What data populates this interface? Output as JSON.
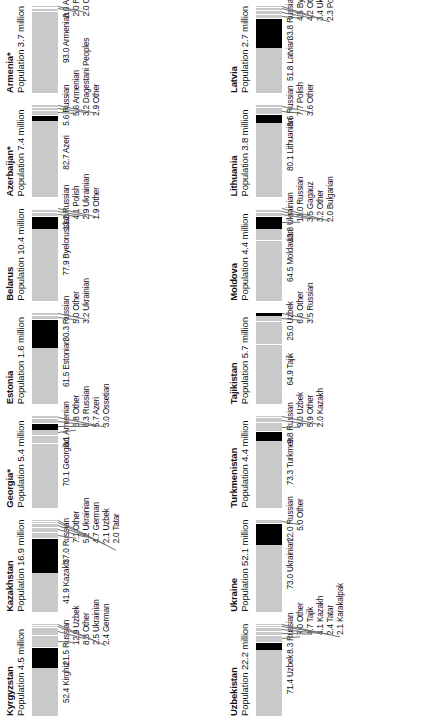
{
  "figure": {
    "population_prefix": "Population",
    "population_suffix": "million",
    "footnote_marker": "*",
    "colors": {
      "titular_group": "#c9c9c9",
      "russian_group": "#000000",
      "other_group": "#c9c9c9",
      "leader_line": "#6f6f6f",
      "text": "#111111",
      "background": "#ffffff"
    }
  },
  "chart_data": {
    "type": "bar",
    "xlabel": "",
    "ylabel": "Percent of population",
    "ylim": [
      0,
      100
    ],
    "grid": false,
    "legend": "none",
    "orientation": "horizontal-stacked",
    "note": "Each panel is a 100% stacked bar of ethnic groups; values are percent of population.",
    "panels": [
      {
        "country": "Armenia",
        "starred": true,
        "population_million": "3.7",
        "population_label": "Population 3.7 million",
        "categories": [
          "Armenian",
          "Azeri",
          "Russian",
          "Other"
        ],
        "values": [
          93.0,
          3.0,
          2.0,
          2.0
        ],
        "labels": [
          "93.0  Armenian",
          "3.0  Azeri",
          "2.0  Russian",
          "2.0  Other"
        ],
        "highlight_index": -1
      },
      {
        "country": "Azerbaijan",
        "starred": true,
        "population_million": "7.4",
        "population_label": "Population 7.4 million",
        "categories": [
          "Azeri",
          "Russian",
          "Armenian",
          "Dagestani Peoples",
          "Other"
        ],
        "values": [
          82.7,
          5.6,
          5.6,
          3.2,
          2.9
        ],
        "labels": [
          "82.7  Azeri",
          "5.6  Russian",
          "5.6  Armenian",
          "3.2  Dagestani Peoples",
          "2.9  Other"
        ],
        "highlight_index": 1
      },
      {
        "country": "Belarus",
        "starred": false,
        "population_million": "10.4",
        "population_label": "Population 10.4 million",
        "categories": [
          "Byelorussian",
          "Russian",
          "Polish",
          "Ukrainian",
          "Other"
        ],
        "values": [
          77.9,
          13.2,
          4.1,
          2.9,
          1.9
        ],
        "labels": [
          "77.9  Byelorussian",
          "13.2  Russian",
          "4.1  Polish",
          "2.9  Ukrainian",
          "1.9  Other"
        ],
        "highlight_index": 1
      },
      {
        "country": "Estonia",
        "starred": false,
        "population_million": "1.6",
        "population_label": "Population 1.6 million",
        "categories": [
          "Estonian",
          "Russian",
          "Other",
          "Ukrainian"
        ],
        "values": [
          61.5,
          30.3,
          5.0,
          3.2
        ],
        "labels": [
          "61.5  Estonian",
          "30.3  Russian",
          "5.0  Other",
          "3.2  Ukrainian"
        ],
        "highlight_index": 1
      },
      {
        "country": "Georgia",
        "starred": true,
        "population_million": "5.4",
        "population_label": "Population 5.4 million",
        "categories": [
          "Georgian",
          "Armenian",
          "Other",
          "Russian",
          "Azeri",
          "Ossetian"
        ],
        "values": [
          70.1,
          8.1,
          6.8,
          6.3,
          5.7,
          3.0
        ],
        "labels": [
          "70.1  Georgian",
          "8.1  Armenian",
          "6.8  Other",
          "6.3  Russian",
          "5.7  Azeri",
          "3.0  Ossetian"
        ],
        "highlight_index": 3
      },
      {
        "country": "Kazakhstan",
        "starred": false,
        "population_million": "16.9",
        "population_label": "Population 16.9 million",
        "categories": [
          "Kazakh",
          "Russian",
          "Other",
          "Ukrainian",
          "German",
          "Uzbek",
          "Tatar"
        ],
        "values": [
          41.9,
          37.0,
          7.1,
          5.2,
          4.7,
          2.1,
          2.0
        ],
        "labels": [
          "41.9  Kazakh",
          "37.0  Russian",
          "7.1  Other",
          "5.2  Ukrainian",
          "4.7  German",
          "2.1  Uzbek",
          "2.0  Tatar"
        ],
        "highlight_index": 1
      },
      {
        "country": "Kyrgyzstan",
        "starred": false,
        "population_million": "4.5",
        "population_label": "Population 4.5 million",
        "categories": [
          "Kirghiz",
          "Russian",
          "Uzbek",
          "Other",
          "Ukrainian",
          "German"
        ],
        "values": [
          52.4,
          21.5,
          12.9,
          8.3,
          2.5,
          2.4
        ],
        "labels": [
          "52.4  Kirghiz",
          "21.5  Russian",
          "12.9  Uzbek",
          "8.3  Other",
          "2.5  Ukrainian",
          "2.4  German"
        ],
        "highlight_index": 1
      },
      {
        "country": "Latvia",
        "starred": false,
        "population_million": "2.7",
        "population_label": "Population 2.7 million",
        "categories": [
          "Latvian",
          "Russian",
          "Byelorussian",
          "Other",
          "Ukrainian",
          "Polish"
        ],
        "values": [
          51.8,
          33.8,
          4.5,
          4.2,
          3.4,
          2.3
        ],
        "labels": [
          "51.8  Latvian",
          "33.8  Russian",
          "4.5  Byelorussian",
          "4.2  Other",
          "3.4  Ukrainian",
          "2.3  Polish"
        ],
        "highlight_index": 1
      },
      {
        "country": "Lithuania",
        "starred": false,
        "population_million": "3.8",
        "population_label": "Population 3.8 million",
        "categories": [
          "Lithuanian",
          "Russian",
          "Polish",
          "Other"
        ],
        "values": [
          80.1,
          8.6,
          7.7,
          3.6
        ],
        "labels": [
          "80.1  Lithuanian",
          "8.6  Russian",
          "7.7  Polish",
          "3.6  Other"
        ],
        "highlight_index": 1
      },
      {
        "country": "Moldova",
        "starred": false,
        "population_million": "4.4",
        "population_label": "Population 4.4 million",
        "categories": [
          "Moldavian",
          "Ukrainian",
          "Russian",
          "Gagauz",
          "Other",
          "Bulgarian"
        ],
        "values": [
          64.5,
          13.8,
          13.0,
          3.5,
          3.2,
          2.0
        ],
        "labels": [
          "64.5  Moldavian",
          "13.8  Ukrainian",
          "13.0  Russian",
          "3.5  Gagauz",
          "3.2  Other",
          "2.0  Bulgarian"
        ],
        "highlight_index": 2
      },
      {
        "country": "Tajikistan",
        "starred": false,
        "population_million": "5.7",
        "population_label": "Population 5.7 million",
        "categories": [
          "Tajik",
          "Uzbek",
          "Other",
          "Russian"
        ],
        "values": [
          64.9,
          25.0,
          6.6,
          3.5
        ],
        "labels": [
          "64.9  Tajik",
          "25.0  Uzbek",
          "6.6  Other",
          "3.5  Russian"
        ],
        "highlight_index": 3
      },
      {
        "country": "Turkmenistan",
        "starred": false,
        "population_million": "4.4",
        "population_label": "Population 4.4 million",
        "categories": [
          "Turkmen",
          "Russian",
          "Uzbek",
          "Other",
          "Kazakh"
        ],
        "values": [
          73.3,
          9.8,
          9.0,
          5.9,
          2.0
        ],
        "labels": [
          "73.3  Turkmen",
          "9.8  Russian",
          "9.0  Uzbek",
          "5.9  Other",
          "2.0  Kazakh"
        ],
        "highlight_index": 1
      },
      {
        "country": "Ukraine",
        "starred": false,
        "population_million": "52.1",
        "population_label": "Population 52.1 million",
        "categories": [
          "Ukrainian",
          "Russian",
          "Other"
        ],
        "values": [
          73.0,
          22.0,
          5.0
        ],
        "labels": [
          "73.0  Ukrainian",
          "22.0  Russian",
          "5.0  Other"
        ],
        "highlight_index": 1
      },
      {
        "country": "Uzbekistan",
        "starred": false,
        "population_million": "22.2",
        "population_label": "Population 22.2 million",
        "categories": [
          "Uzbek",
          "Russian",
          "Other",
          "Tajik",
          "Kazakh",
          "Tatar",
          "Karakalpak"
        ],
        "values": [
          71.4,
          8.3,
          7.0,
          4.7,
          4.1,
          2.4,
          2.1
        ],
        "labels": [
          "71.4  Uzbek",
          "8.3  Russian",
          "7.0  Other",
          "4.7  Tajik",
          "4.1  Kazakh",
          "2.4  Tatar",
          "2.1  Karakalpak"
        ],
        "highlight_index": 1
      }
    ]
  },
  "column_order": {
    "left": [
      "Armenia",
      "Azerbaijan",
      "Belarus",
      "Estonia",
      "Georgia",
      "Kazakhstan",
      "Kyrgyzstan"
    ],
    "right": [
      "Latvia",
      "Lithuania",
      "Moldova",
      "Tajikistan",
      "Turkmenistan",
      "Ukraine",
      "Uzbekistan"
    ]
  }
}
